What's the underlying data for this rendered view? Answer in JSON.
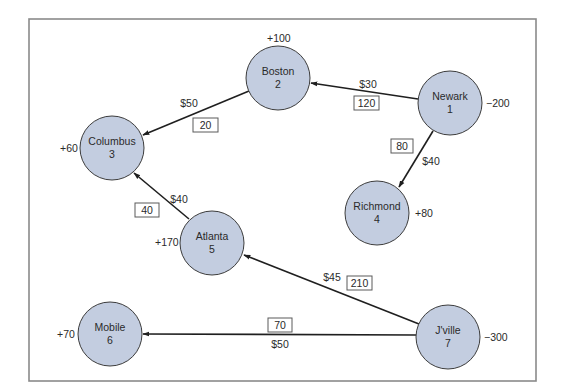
{
  "diagram": {
    "type": "transportation-network",
    "colors": {
      "node_fill": "#c3cde0",
      "node_stroke": "#3c3c3c",
      "edge": "#1f1f1f",
      "frame": "#8a8a8a"
    },
    "nodes": [
      {
        "id": 1,
        "name": "Newark",
        "number": "1",
        "supply": "−200",
        "cx": 450,
        "cy": 103
      },
      {
        "id": 2,
        "name": "Boston",
        "number": "2",
        "supply": "+100",
        "cx": 278,
        "cy": 78
      },
      {
        "id": 3,
        "name": "Columbus",
        "number": "3",
        "supply": "+60",
        "cx": 112,
        "cy": 148
      },
      {
        "id": 4,
        "name": "Richmond",
        "number": "4",
        "supply": "+80",
        "cx": 377,
        "cy": 213
      },
      {
        "id": 5,
        "name": "Atlanta",
        "number": "5",
        "supply": "+170",
        "cx": 212,
        "cy": 243
      },
      {
        "id": 6,
        "name": "Mobile",
        "number": "6",
        "supply": "+70",
        "cx": 110,
        "cy": 334
      },
      {
        "id": 7,
        "name": "J'ville",
        "number": "7",
        "supply": "−300",
        "cx": 448,
        "cy": 337
      }
    ],
    "edges": [
      {
        "from": 1,
        "to": 2,
        "cost": "$30",
        "flow": "120"
      },
      {
        "from": 1,
        "to": 4,
        "cost": "$40",
        "flow": "80"
      },
      {
        "from": 2,
        "to": 3,
        "cost": "$50",
        "flow": "20"
      },
      {
        "from": 5,
        "to": 3,
        "cost": "$40",
        "flow": "40"
      },
      {
        "from": 7,
        "to": 5,
        "cost": "$45",
        "flow": "210"
      },
      {
        "from": 7,
        "to": 6,
        "cost": "$50",
        "flow": "70"
      }
    ]
  }
}
